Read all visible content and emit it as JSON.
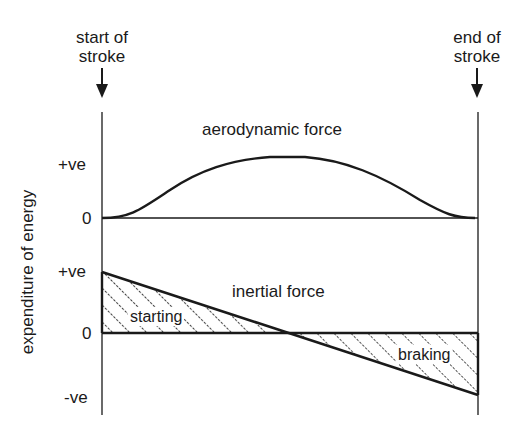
{
  "markers": {
    "start": {
      "line1": "start of",
      "line2": "stroke"
    },
    "end": {
      "line1": "end of",
      "line2": "stroke"
    }
  },
  "y_axis_label": "expenditure of energy",
  "panels": {
    "aerodynamic": {
      "title": "aerodynamic force",
      "tick_pos": "+ve",
      "tick_zero": "0"
    },
    "inertial": {
      "title": "inertial force",
      "tick_pos": "+ve",
      "tick_zero": "0",
      "tick_neg": "-ve",
      "region_start": "starting",
      "region_end": "braking"
    }
  },
  "colors": {
    "ink": "#1a1a1a",
    "background": "#ffffff"
  }
}
